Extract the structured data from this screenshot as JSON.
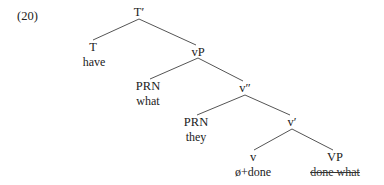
{
  "example_number": "(20)",
  "nodes": {
    "tbar": {
      "label": "T′",
      "x": 139,
      "y": 5
    },
    "t": {
      "label": "T",
      "x": 93,
      "y": 40,
      "word": "have"
    },
    "vp_small": {
      "label": "vP",
      "x": 198,
      "y": 45
    },
    "prn1": {
      "label": "PRN",
      "x": 148,
      "y": 79,
      "word": "what"
    },
    "vdoublebar": {
      "label": "v″",
      "x": 245,
      "y": 81
    },
    "prn2": {
      "label": "PRN",
      "x": 196,
      "y": 115,
      "word": "they"
    },
    "vbar": {
      "label": "v′",
      "x": 292,
      "y": 115
    },
    "v": {
      "label": "v",
      "x": 253,
      "y": 150,
      "word": "ø+done"
    },
    "vp_big": {
      "label": "VP",
      "x": 335,
      "y": 150,
      "word": "done what",
      "word_struck": true
    }
  },
  "edges": [
    [
      "tbar",
      "t"
    ],
    [
      "tbar",
      "vp_small"
    ],
    [
      "vp_small",
      "prn1"
    ],
    [
      "vp_small",
      "vdoublebar"
    ],
    [
      "vdoublebar",
      "prn2"
    ],
    [
      "vdoublebar",
      "vbar"
    ],
    [
      "vbar",
      "v"
    ],
    [
      "vbar",
      "vp_big"
    ]
  ],
  "colors": {
    "line": "#555555",
    "text": "#222222"
  }
}
